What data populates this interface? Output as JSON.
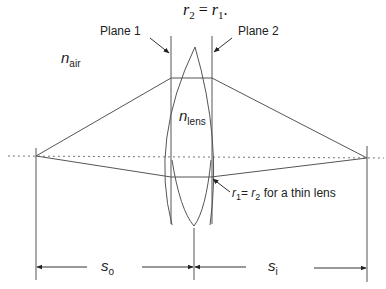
{
  "equation": {
    "lhs_var": "r",
    "lhs_sub": "2",
    "operator": " = ",
    "rhs_var": "r",
    "rhs_sub": "1",
    "terminator": "."
  },
  "labels": {
    "plane1": "Plane 1",
    "plane2": "Plane 2",
    "n_air_var": "n",
    "n_air_sub": "air",
    "n_lens_var": "n",
    "n_lens_sub": "lens",
    "thin_lens_r1_var": "r",
    "thin_lens_r1_sub": "1",
    "thin_lens_eq": "= ",
    "thin_lens_r2_var": "r",
    "thin_lens_r2_sub": "2",
    "thin_lens_text": " for a thin lens",
    "object_distance_var": "s",
    "object_distance_sub": "o",
    "image_distance_var": "s",
    "image_distance_sub": "i"
  },
  "colors": {
    "line": "#555555",
    "axis": "#777777",
    "text": "#222222",
    "background": "#ffffff"
  }
}
